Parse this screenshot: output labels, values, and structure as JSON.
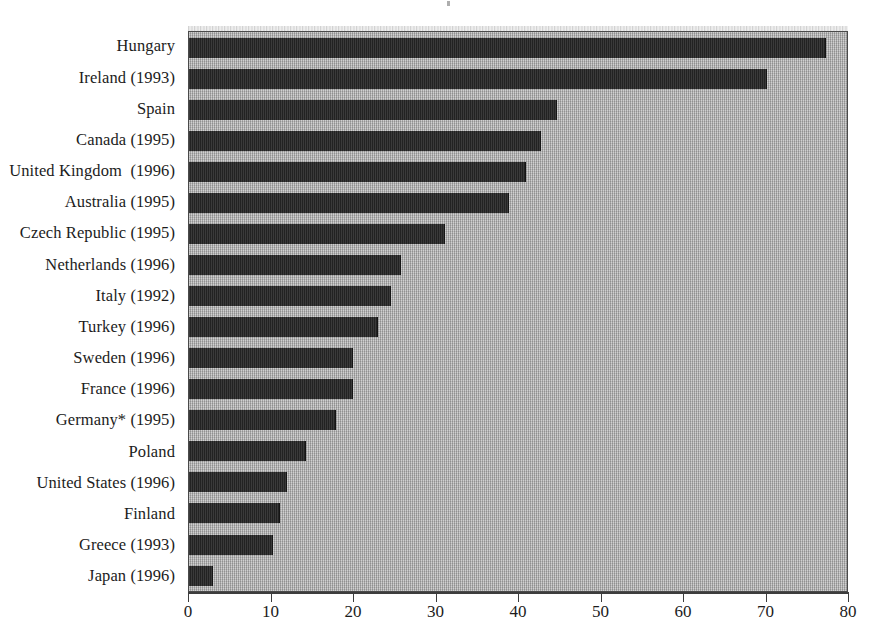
{
  "chart_data": {
    "type": "bar",
    "orientation": "horizontal",
    "title": "",
    "subtitle": "",
    "xlabel": "",
    "ylabel": "",
    "xlim": [
      0,
      80
    ],
    "xticks": [
      0,
      10,
      20,
      30,
      40,
      50,
      60,
      70,
      80
    ],
    "tick_labels": [
      "0",
      "10",
      "20",
      "30",
      "40",
      "50",
      "60",
      "70",
      "80"
    ],
    "grid": false,
    "legend": "none",
    "bar_color": "#2b2b2b",
    "plot_background": "#a9a9a9",
    "categories": [
      "Hungary",
      "Ireland (1993)",
      "Spain",
      "Canada (1995)",
      "United Kingdom  (1996)",
      "Australia (1995)",
      "Czech Republic (1995)",
      "Netherlands (1996)",
      "Italy (1992)",
      "Turkey (1996)",
      "Sweden (1996)",
      "France (1996)",
      "Germany* (1995)",
      "Poland",
      "United States (1996)",
      "Finland",
      "Greece (1993)",
      "Japan (1996)"
    ],
    "values": [
      77.2,
      70.0,
      44.6,
      42.7,
      40.8,
      38.8,
      31.0,
      25.7,
      24.5,
      22.9,
      19.9,
      19.9,
      17.8,
      14.2,
      11.9,
      11.0,
      10.2,
      2.9
    ]
  },
  "footnote": ""
}
